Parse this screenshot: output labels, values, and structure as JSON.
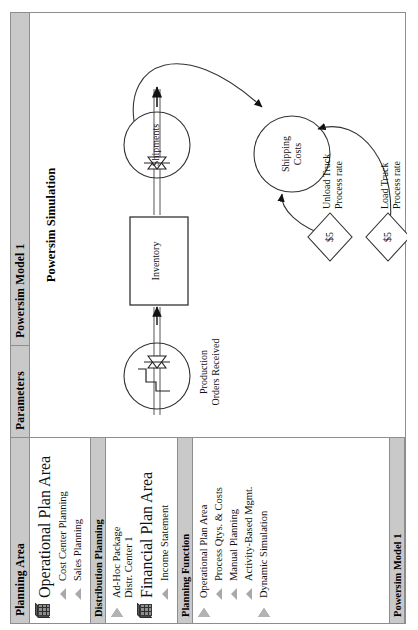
{
  "header": {
    "cells": [
      {
        "label": "Planning Area"
      },
      {
        "label": "Parameters"
      },
      {
        "label": "Powersim Model 1"
      }
    ]
  },
  "left_panel": {
    "sections": [
      {
        "title": "",
        "items": [
          {
            "icon": "cube-icon",
            "label": "Operational Plan Area",
            "level": 0
          },
          {
            "icon": "leaf-triangle-icon",
            "label": "Cost Center Planning",
            "level": 1
          },
          {
            "icon": "leaf-triangle-icon",
            "label": "Sales Planning",
            "level": 1
          }
        ]
      },
      {
        "title": "Distribution Planning",
        "items": [
          {
            "icon": "play-triangle-icon",
            "label": "Ad-Hoc Package\nDistr. Center 1",
            "level": 0
          },
          {
            "icon": "cube-icon",
            "label": "Financial Plan Area",
            "level": 0
          },
          {
            "icon": "leaf-triangle-icon",
            "label": "Income Statement",
            "level": 1
          }
        ]
      },
      {
        "title": "Planning Function",
        "items": [
          {
            "icon": "play-triangle-icon",
            "label": "Operational Plan Area",
            "level": 0
          },
          {
            "icon": "leaf-triangle-icon",
            "label": "Process Qtys. & Costs",
            "level": 1
          },
          {
            "icon": "leaf-triangle-icon",
            "label": "Manual Planning",
            "level": 1
          },
          {
            "icon": "leaf-triangle-icon",
            "label": "Activity-Based Mgmt.",
            "level": 1
          },
          {
            "icon": "play-triangle-icon",
            "label": "Dynamic Simulation",
            "level": 0
          }
        ]
      }
    ],
    "footer_bar": "Powersim Model 1"
  },
  "canvas": {
    "title": "Powersim Simulation",
    "nodes": {
      "stock": "Inventory",
      "inflow_cloud": "Production\nOrders Received",
      "outflow_cloud": "Shipments",
      "aux": "Shipping\nCosts",
      "const_unload_value": "$5",
      "const_unload_label": "Unload Truck\nProcess rate",
      "const_load_value": "$5",
      "const_load_label": "Load Truck\nProcess rate"
    }
  },
  "colors": {
    "header_bar": "#c9c9c9",
    "border": "#8d8d8d",
    "icon_grey": "#a9a9a9",
    "ink": "#111111"
  }
}
